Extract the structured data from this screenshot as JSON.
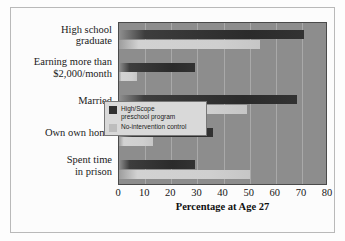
{
  "chart_data": {
    "type": "bar",
    "orientation": "horizontal",
    "title": "",
    "xlabel": "Percentage at Age 27",
    "ylabel": "",
    "xlim": [
      0,
      80
    ],
    "xticks": [
      0,
      10,
      20,
      30,
      40,
      50,
      60,
      70,
      80
    ],
    "grid": true,
    "legend_position": "inside-right",
    "categories": [
      "High school graduate",
      "Earning more than $2,000/month",
      "Married",
      "Own own home",
      "Spent time in prison"
    ],
    "category_lines": [
      [
        "High school",
        "graduate"
      ],
      [
        "Earning more than",
        "$2,000/month"
      ],
      [
        "Married"
      ],
      [
        "Own own home"
      ],
      [
        "Spent time",
        "in prison"
      ]
    ],
    "series": [
      {
        "name": "High/Scope preschool program",
        "color": "#303030",
        "values": [
          71,
          29,
          68,
          36,
          29
        ]
      },
      {
        "name": "No-intervention control",
        "color": "#cccccc",
        "values": [
          54,
          7,
          49,
          13,
          50
        ]
      }
    ]
  },
  "legend": {
    "entries": [
      {
        "label_line1": "High/Scope",
        "label_line2": "preschool program",
        "color": "#303030"
      },
      {
        "label_line1": "No-intervention control",
        "label_line2": "",
        "color": "#bdbdbd"
      }
    ]
  },
  "axis": {
    "x_label": "Percentage at Age 27",
    "tick_labels": [
      "0",
      "10",
      "20",
      "30",
      "40",
      "50",
      "60",
      "70",
      "80"
    ]
  },
  "colors": {
    "plot_background": "#8d8d8d",
    "gridline": "#a9a9a9",
    "treatment_bar": "#303030",
    "control_bar": "#cccccc",
    "figure_background": "#fdfdfd",
    "frame": "#b9b9b9"
  }
}
